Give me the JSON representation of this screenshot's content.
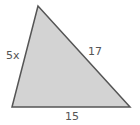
{
  "diagram": {
    "shape": "triangle",
    "fill_color": "#d3d3d3",
    "stroke_color": "#555555",
    "sides": {
      "left": "5x",
      "hypotenuse": "17",
      "base": "15"
    }
  }
}
